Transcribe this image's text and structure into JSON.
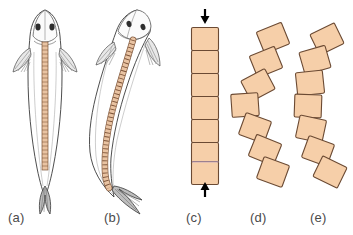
{
  "figure": {
    "background": "#ffffff",
    "width": 353,
    "height": 235
  },
  "colors": {
    "block_fill": "#f6cfa9",
    "block_fill_light": "#fadcbe",
    "block_stroke": "#6b4a33",
    "outline": "#3a3a3a",
    "fin_shade": "#8a8a8a",
    "spine_fill": "#e2b892",
    "spine_stroke": "#7a5136",
    "label_color": "#4a4a4a",
    "arrow_color": "#000000",
    "notochord_tint": "#b9a0c7"
  },
  "panels": [
    {
      "id": "a",
      "label": "(a)",
      "name": "fish-straight",
      "caption_x": 8,
      "caption_y": 210,
      "subject": "fish",
      "posture": "straight",
      "vertebra_count": 34,
      "features": [
        "head",
        "eyes",
        "pectoral-fins",
        "body-outline",
        "vertebral-column",
        "caudal-fin"
      ]
    },
    {
      "id": "b",
      "label": "(b)",
      "name": "fish-bent",
      "caption_x": 104,
      "caption_y": 210,
      "subject": "fish",
      "posture": "laterally-bent",
      "vertebra_count": 34,
      "features": [
        "head",
        "eyes",
        "pectoral-fins",
        "body-outline",
        "vertebral-column",
        "caudal-fin"
      ]
    },
    {
      "id": "c",
      "label": "(c)",
      "name": "vertebral-chain-straight",
      "caption_x": 186,
      "caption_y": 210,
      "subject": "vertebral-segment-chain",
      "posture": "straight-compressed",
      "segment_count": 7,
      "arrows": [
        {
          "name": "compression-arrow-top",
          "direction": "down",
          "x": 205,
          "y_tip": 22
        },
        {
          "name": "compression-arrow-bottom",
          "direction": "up",
          "x": 205,
          "y_tip": 184
        }
      ]
    },
    {
      "id": "d",
      "label": "(d)",
      "name": "vertebral-chain-kinked",
      "caption_x": 250,
      "caption_y": 210,
      "subject": "vertebral-segment-chain",
      "posture": "kinked-buckled",
      "segment_count": 7
    },
    {
      "id": "e",
      "label": "(e)",
      "name": "vertebral-chain-curved",
      "caption_x": 310,
      "caption_y": 210,
      "subject": "vertebral-segment-chain",
      "posture": "smoothly-curved",
      "segment_count": 7
    }
  ],
  "chains": {
    "c": {
      "blocks": [
        {
          "cx": 205,
          "cy": 39,
          "w": 27,
          "h": 23,
          "rot": 0
        },
        {
          "cx": 205,
          "cy": 62,
          "w": 27,
          "h": 23,
          "rot": 0
        },
        {
          "cx": 205,
          "cy": 85,
          "w": 27,
          "h": 23,
          "rot": 0
        },
        {
          "cx": 205,
          "cy": 108,
          "w": 27,
          "h": 23,
          "rot": 0
        },
        {
          "cx": 205,
          "cy": 131,
          "w": 27,
          "h": 23,
          "rot": 0
        },
        {
          "cx": 205,
          "cy": 154,
          "w": 27,
          "h": 23,
          "rot": 0
        },
        {
          "cx": 205,
          "cy": 172,
          "w": 27,
          "h": 23,
          "rot": 0
        }
      ]
    },
    "d": {
      "blocks": [
        {
          "cx": 273,
          "cy": 38,
          "w": 27,
          "h": 23,
          "rot": -22
        },
        {
          "cx": 266,
          "cy": 62,
          "w": 27,
          "h": 23,
          "rot": -22
        },
        {
          "cx": 258,
          "cy": 85,
          "w": 27,
          "h": 23,
          "rot": -28
        },
        {
          "cx": 245,
          "cy": 105,
          "w": 27,
          "h": 23,
          "rot": -4
        },
        {
          "cx": 255,
          "cy": 128,
          "w": 27,
          "h": 23,
          "rot": 20
        },
        {
          "cx": 265,
          "cy": 150,
          "w": 27,
          "h": 23,
          "rot": 22
        },
        {
          "cx": 273,
          "cy": 172,
          "w": 27,
          "h": 23,
          "rot": 20
        }
      ]
    },
    "e": {
      "blocks": [
        {
          "cx": 327,
          "cy": 39,
          "w": 27,
          "h": 23,
          "rot": -26
        },
        {
          "cx": 315,
          "cy": 60,
          "w": 27,
          "h": 23,
          "rot": -16
        },
        {
          "cx": 310,
          "cy": 83,
          "w": 27,
          "h": 23,
          "rot": -6
        },
        {
          "cx": 308,
          "cy": 106,
          "w": 27,
          "h": 23,
          "rot": 2
        },
        {
          "cx": 311,
          "cy": 129,
          "w": 27,
          "h": 23,
          "rot": 12
        },
        {
          "cx": 318,
          "cy": 151,
          "w": 27,
          "h": 23,
          "rot": 20
        },
        {
          "cx": 330,
          "cy": 172,
          "w": 27,
          "h": 23,
          "rot": 26
        }
      ]
    }
  }
}
